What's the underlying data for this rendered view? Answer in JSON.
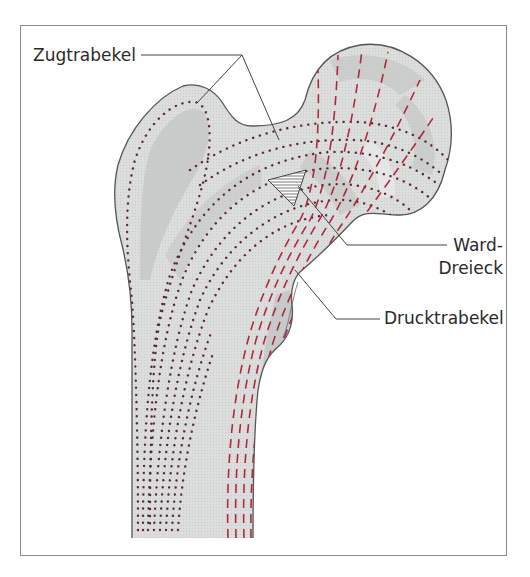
{
  "figure": {
    "labels": {
      "zugtrabekel": "Zugtrabekel",
      "ward_line1": "Ward-",
      "ward_line2": "Dreieck",
      "drucktrabekel": "Drucktrabekel"
    },
    "colors": {
      "frame": "#8a8a8a",
      "bone_fill": "#d9dbdb",
      "bone_shade": "#c6c8c8",
      "bone_outline": "#555555",
      "tension_dots": "#5a2a32",
      "compression_dashes": "#b0283a",
      "leader_lines": "#444444",
      "text": "#2a2a2a"
    }
  }
}
